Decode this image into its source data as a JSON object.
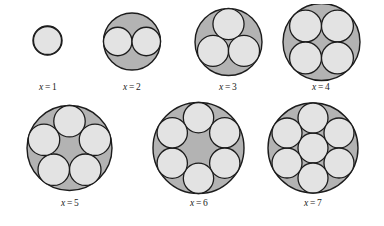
{
  "figure": {
    "title": "",
    "background_color": "#ffffff",
    "outer_circle_fill": "#b3b3b3",
    "inner_circle_fill": "#e3e3e3",
    "stroke_color": "#1c1c1c",
    "label_color": "#1a1a1a",
    "label_variable": "x",
    "label_equals": "=",
    "cells": [
      {
        "id": "packing-1",
        "label_value": "1",
        "label_text": "x = 1",
        "count": 1,
        "outer": {
          "cx": 47.5,
          "cy": 40.5,
          "r": 14.5
        },
        "inner_radius": 14.0,
        "inner_centers": [
          {
            "cx": 47.5,
            "cy": 40.5
          }
        ],
        "box": {
          "left": 8,
          "top": 4,
          "width": 80,
          "height": 100
        },
        "label_top": 82
      },
      {
        "id": "packing-2",
        "label_value": "2",
        "label_text": "x = 2",
        "count": 2,
        "outer": {
          "cx": 132.0,
          "cy": 41.5,
          "r": 28.5
        },
        "inner_radius": 14.25,
        "inner_centers": [
          {
            "cx": 117.75,
            "cy": 41.5
          },
          {
            "cx": 146.25,
            "cy": 41.5
          }
        ],
        "box": {
          "left": 92,
          "top": 4,
          "width": 80,
          "height": 100
        },
        "label_top": 82
      },
      {
        "id": "packing-3",
        "label_value": "3",
        "label_text": "x = 3",
        "count": 3,
        "outer": {
          "cx": 228.5,
          "cy": 42.0,
          "r": 33.5
        },
        "inner_radius": 15.55,
        "inner_centers": [
          {
            "cx": 228.5,
            "cy": 24.1
          },
          {
            "cx": 213.0,
            "cy": 50.9
          },
          {
            "cx": 244.0,
            "cy": 50.9
          }
        ],
        "box": {
          "left": 188,
          "top": 4,
          "width": 80,
          "height": 100
        },
        "label_top": 82
      },
      {
        "id": "packing-4",
        "label_value": "4",
        "label_text": "x = 4",
        "count": 4,
        "outer": {
          "cx": 321.5,
          "cy": 42.0,
          "r": 38.5
        },
        "inner_radius": 15.95,
        "inner_centers": [
          {
            "cx": 305.55,
            "cy": 26.05
          },
          {
            "cx": 337.45,
            "cy": 26.05
          },
          {
            "cx": 305.55,
            "cy": 57.95
          },
          {
            "cx": 337.45,
            "cy": 57.95
          }
        ],
        "box": {
          "left": 278,
          "top": 4,
          "width": 86,
          "height": 100
        },
        "label_top": 82
      },
      {
        "id": "packing-5",
        "label_value": "5",
        "label_text": "x = 5",
        "count": 5,
        "outer": {
          "cx": 69.5,
          "cy": 148.0,
          "r": 42.5
        },
        "inner_radius": 15.73,
        "inner_centers": [
          {
            "cx": 69.5,
            "cy": 121.23
          },
          {
            "cx": 95.0,
            "cy": 139.76
          },
          {
            "cx": 85.26,
            "cy": 169.73
          },
          {
            "cx": 53.74,
            "cy": 169.73
          },
          {
            "cx": 44.0,
            "cy": 139.76
          }
        ],
        "box": {
          "left": 22,
          "top": 102,
          "width": 96,
          "height": 118
        },
        "label_top": 198
      },
      {
        "id": "packing-6",
        "label_value": "6",
        "label_text": "x = 6",
        "count": 6,
        "outer": {
          "cx": 198.5,
          "cy": 148.0,
          "r": 45.5
        },
        "inner_radius": 15.17,
        "inner_centers": [
          {
            "cx": 198.5,
            "cy": 117.67
          },
          {
            "cx": 224.76,
            "cy": 132.84
          },
          {
            "cx": 224.76,
            "cy": 163.16
          },
          {
            "cx": 198.5,
            "cy": 178.33
          },
          {
            "cx": 172.24,
            "cy": 163.16
          },
          {
            "cx": 172.24,
            "cy": 132.84
          }
        ],
        "box": {
          "left": 150,
          "top": 100,
          "width": 98,
          "height": 120
        },
        "label_top": 198
      },
      {
        "id": "packing-7",
        "label_value": "7",
        "label_text": "x = 7",
        "count": 7,
        "outer": {
          "cx": 313.0,
          "cy": 148.0,
          "r": 45.0
        },
        "inner_radius": 15.0,
        "inner_centers": [
          {
            "cx": 313.0,
            "cy": 148.0
          },
          {
            "cx": 313.0,
            "cy": 118.0
          },
          {
            "cx": 338.98,
            "cy": 133.0
          },
          {
            "cx": 338.98,
            "cy": 163.0
          },
          {
            "cx": 313.0,
            "cy": 178.0
          },
          {
            "cx": 287.02,
            "cy": 163.0
          },
          {
            "cx": 287.02,
            "cy": 133.0
          }
        ],
        "box": {
          "left": 265,
          "top": 100,
          "width": 96,
          "height": 120
        },
        "label_top": 198
      }
    ]
  }
}
